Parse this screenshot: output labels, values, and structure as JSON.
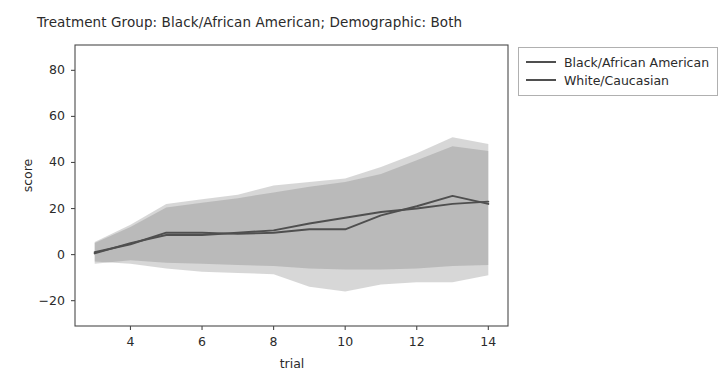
{
  "figure": {
    "title": "Treatment Group: Black/African American; Demographic: Both",
    "xlabel": "trial",
    "ylabel": "score"
  },
  "legend": {
    "entries": [
      {
        "label": "Black/African American",
        "color": "#4f4f4f"
      },
      {
        "label": "White/Caucasian",
        "color": "#4f4f4f"
      }
    ]
  },
  "axis": {
    "x_ticks": [
      "4",
      "6",
      "8",
      "10",
      "12",
      "14"
    ],
    "y_ticks": [
      "80",
      "60",
      "40",
      "20",
      "0",
      "−20"
    ]
  },
  "chart_data": {
    "type": "line",
    "title": "Treatment Group: Black/African American; Demographic: Both",
    "xlabel": "trial",
    "ylabel": "score",
    "xlim": [
      2.45,
      14.55
    ],
    "ylim": [
      -31,
      91
    ],
    "x_ticks": [
      4,
      6,
      8,
      10,
      12,
      14
    ],
    "y_ticks": [
      -20,
      0,
      20,
      40,
      60,
      80
    ],
    "grid": false,
    "legend_position": "upper right outside",
    "x": [
      3,
      4,
      5,
      6,
      7,
      8,
      9,
      10,
      11,
      12,
      13,
      14
    ],
    "series": [
      {
        "name": "Black/African American",
        "color": "#4f4f4f",
        "values": [
          1.0,
          4.5,
          9.5,
          9.5,
          9.0,
          9.5,
          11.0,
          11.0,
          17.0,
          21.0,
          25.5,
          22.0
        ],
        "band_lower": [
          -3.0,
          -4.0,
          -6.0,
          -7.5,
          -8.0,
          -8.5,
          -14.0,
          -16.0,
          -13.0,
          -12.0,
          -12.0,
          -9.0
        ],
        "band_upper": [
          5.5,
          13.0,
          22.0,
          24.0,
          26.0,
          30.0,
          31.5,
          33.0,
          38.0,
          44.0,
          51.0,
          48.0
        ],
        "band_alpha": 0.28
      },
      {
        "name": "White/Caucasian",
        "color": "#4f4f4f",
        "values": [
          0.5,
          5.0,
          8.5,
          8.5,
          9.5,
          10.5,
          13.5,
          16.0,
          18.5,
          20.0,
          22.0,
          23.0
        ],
        "band_lower": [
          -4.0,
          -2.5,
          -3.5,
          -4.0,
          -4.5,
          -5.0,
          -6.0,
          -6.5,
          -6.5,
          -6.0,
          -5.0,
          -4.5
        ],
        "band_upper": [
          5.0,
          12.0,
          20.5,
          22.5,
          24.5,
          27.0,
          29.5,
          31.5,
          35.0,
          41.0,
          47.0,
          45.0
        ],
        "band_alpha": 0.28
      }
    ]
  }
}
